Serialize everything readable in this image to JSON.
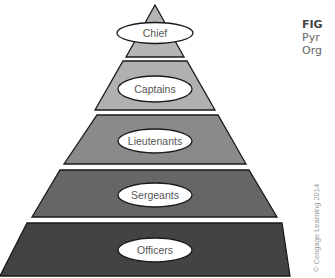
{
  "caption": {
    "figure_label": "FIG",
    "line1": "Pyr",
    "line2": "Org"
  },
  "copyright": "© Cengage Learning 2014",
  "pyramid": {
    "tiers": [
      {
        "label": "Chief",
        "color": "#b4b4b4"
      },
      {
        "label": "Captains",
        "color": "#b0b0b0"
      },
      {
        "label": "Lieutenants",
        "color": "#8a8a8a"
      },
      {
        "label": "Sergeants",
        "color": "#666666"
      },
      {
        "label": "Officers",
        "color": "#434343"
      }
    ]
  }
}
